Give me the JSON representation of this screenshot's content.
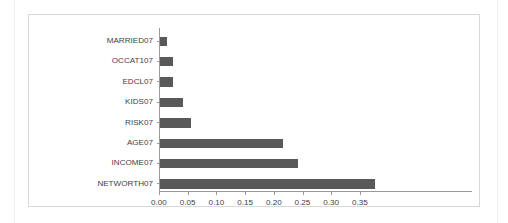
{
  "chart_data": {
    "type": "bar",
    "orientation": "horizontal",
    "title": "",
    "xlabel": "",
    "ylabel": "",
    "categories": [
      "MARRIED07",
      "OCCAT107",
      "EDCL07",
      "KIDS07",
      "RISK07",
      "AGE07",
      "INCOME07",
      "NETWORTH07"
    ],
    "values": [
      0.013,
      0.022,
      0.022,
      0.04,
      0.054,
      0.215,
      0.24,
      0.375
    ],
    "xticks": [
      0.0,
      0.05,
      0.1,
      0.15,
      0.2,
      0.25,
      0.3,
      0.35
    ],
    "xtick_labels": [
      "0.00",
      "0.05",
      "0.10",
      "0.15",
      "0.20",
      "0.25",
      "0.30",
      "0.35"
    ],
    "xlim": [
      0.0,
      0.3875
    ],
    "grid": false,
    "legend": false,
    "bar_color": "#595959",
    "axis_color": "#9a9a9a",
    "text_color": "#3f3f3f",
    "background_color": "#ffffff",
    "frame_color": "#d9d9d9"
  }
}
